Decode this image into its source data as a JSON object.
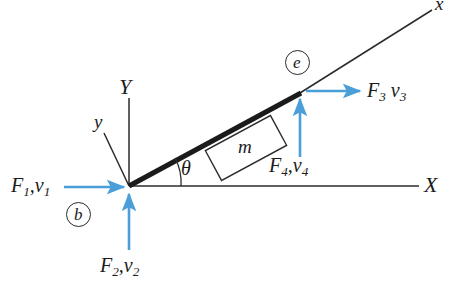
{
  "figure": {
    "background_color": "#ffffff",
    "line_color": "#2b2b2b",
    "arrow_color": "#4a9fd8"
  },
  "axes": {
    "global_x": {
      "label": "X",
      "description": "horizontal global axis to the right"
    },
    "global_y": {
      "label": "Y",
      "description": "vertical global axis upward"
    },
    "local_x": {
      "label": "x",
      "description": "local axis along the inclined bar"
    },
    "local_y": {
      "label": "y",
      "description": "local axis perpendicular to the inclined bar"
    }
  },
  "angle": {
    "symbol": "θ",
    "description": "inclination angle between global X axis and the bar"
  },
  "mass": {
    "label": "m",
    "description": "mass of the inclined bar element"
  },
  "nodes": [
    {
      "id": "b",
      "label": "b",
      "description": "beginning node at the origin"
    },
    {
      "id": "e",
      "label": "e",
      "description": "end node at the upper tip of the bar"
    }
  ],
  "forces": [
    {
      "id": "F1",
      "symbol": "F",
      "index": "1",
      "velocity_symbol": "v",
      "velocity_index": "1",
      "text": "F₁,v₁",
      "separator": ",",
      "direction": "right",
      "at_node": "b"
    },
    {
      "id": "F2",
      "symbol": "F",
      "index": "2",
      "velocity_symbol": "v",
      "velocity_index": "2",
      "text": "F₂,v₂",
      "separator": ",",
      "direction": "up",
      "at_node": "b"
    },
    {
      "id": "F3",
      "symbol": "F",
      "index": "3",
      "velocity_symbol": "v",
      "velocity_index": "3",
      "text": "F₃ v₃",
      "separator": " ",
      "direction": "right",
      "at_node": "e"
    },
    {
      "id": "F4",
      "symbol": "F",
      "index": "4",
      "velocity_symbol": "v",
      "velocity_index": "4",
      "text": "F₄, v₄",
      "separator": ",",
      "direction": "up",
      "at_node": "e"
    }
  ]
}
